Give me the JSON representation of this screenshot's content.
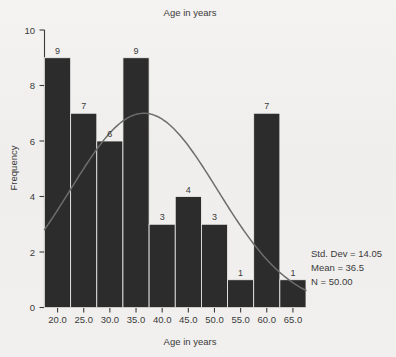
{
  "chart_data": {
    "type": "bar",
    "title": "Age in years",
    "xlabel": "Age in years",
    "ylabel": "Frequency",
    "xlim": [
      17.5,
      67.5
    ],
    "ylim": [
      0,
      10
    ],
    "grid": false,
    "legend": null,
    "bin_width": 5,
    "bin_starts": [
      17.5,
      22.5,
      27.5,
      32.5,
      37.5,
      42.5,
      47.5,
      52.5,
      57.5,
      62.5
    ],
    "bin_centers": [
      20.0,
      25.0,
      30.0,
      35.0,
      40.0,
      45.0,
      50.0,
      55.0,
      60.0,
      65.0
    ],
    "categories": [
      "20.0",
      "25.0",
      "30.0",
      "35.0",
      "40.0",
      "45.0",
      "50.0",
      "55.0",
      "60.0",
      "65.0"
    ],
    "values": [
      9,
      7,
      6,
      9,
      3,
      4,
      3,
      1,
      7,
      1
    ],
    "bar_labels": [
      "9",
      "7",
      "6",
      "9",
      "3",
      "4",
      "3",
      "1",
      "7",
      "1"
    ],
    "xticks": [
      "20.0",
      "25.0",
      "30.0",
      "35.0",
      "40.0",
      "45.0",
      "50.0",
      "55.0",
      "60.0",
      "65.0"
    ],
    "yticks": [
      "0",
      "2",
      "4",
      "6",
      "8",
      "10"
    ],
    "ytick_values": [
      0,
      2,
      4,
      6,
      8,
      10
    ],
    "overlay": {
      "type": "normal-curve",
      "mean": 36.5,
      "std_dev": 14.05,
      "n": 50,
      "peak_value": 7.0
    },
    "colors": {
      "bar_fill": "#2c2c2c",
      "curve": "#6d6d6d",
      "axis": "#3b3b3b",
      "text": "#3a3a3a",
      "background": "#f1f0ee"
    }
  },
  "stats_box": {
    "std_dev": "Std. Dev = 14.05",
    "mean": "Mean = 36.5",
    "n": "N = 50.00"
  }
}
